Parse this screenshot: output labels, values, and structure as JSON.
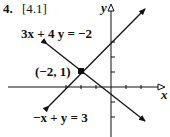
{
  "problem": {
    "number": "4.",
    "section": "[4.1]"
  },
  "graph": {
    "x_axis_label": "x",
    "y_axis_label": "y",
    "lines": [
      {
        "equation": "3x + 4 y = −2"
      },
      {
        "equation": "−x + y = 3"
      }
    ],
    "intersection": {
      "label": "(−2, 1)",
      "x": -2,
      "y": 1
    }
  }
}
